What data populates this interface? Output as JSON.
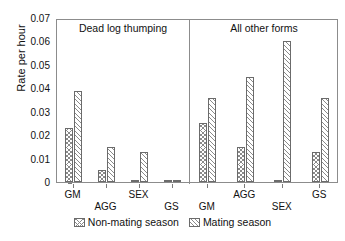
{
  "chart_data": {
    "type": "bar",
    "title": "",
    "xlabel": "",
    "ylabel": "Rate per hour",
    "ylim": [
      0,
      0.07
    ],
    "ytick_labels": [
      "0.07",
      "0.06",
      "0.05",
      "0.04",
      "0.03",
      "0.02",
      "0.01",
      "0"
    ],
    "ytick_values": [
      0.07,
      0.06,
      0.05,
      0.04,
      0.03,
      0.02,
      0.01,
      0
    ],
    "grid": false,
    "legend_position": "bottom",
    "panels": [
      {
        "label": "Dead log thumping",
        "categories": [
          "GM",
          "AGG",
          "SEX",
          "GS"
        ],
        "series": [
          {
            "name": "Non-mating season",
            "values": [
              0.023,
              0.005,
              0.0,
              0.0
            ]
          },
          {
            "name": "Mating season",
            "values": [
              0.039,
              0.015,
              0.013,
              0.0
            ]
          }
        ]
      },
      {
        "label": "All other forms",
        "categories": [
          "GM",
          "AGG",
          "SEX",
          "GS"
        ],
        "series": [
          {
            "name": "Non-mating season",
            "values": [
              0.025,
              0.015,
              0.0,
              0.013
            ]
          },
          {
            "name": "Mating season",
            "values": [
              0.036,
              0.045,
              0.06,
              0.036
            ]
          }
        ]
      }
    ],
    "legend": [
      {
        "name": "Non-mating season",
        "pattern": "cross-hatch"
      },
      {
        "name": "Mating season",
        "pattern": "diagonal-hatch"
      }
    ]
  }
}
